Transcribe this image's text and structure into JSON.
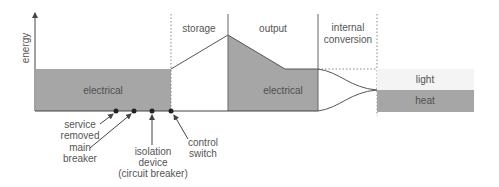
{
  "axis": {
    "y_label": "energy"
  },
  "colors": {
    "fill_gray": "#a6a6a6",
    "light_fill": "#f4f4f4",
    "line": "#555555",
    "text": "#555555"
  },
  "stages": [
    {
      "id": "input",
      "label": ""
    },
    {
      "id": "storage",
      "label": "storage"
    },
    {
      "id": "output",
      "label": "output"
    },
    {
      "id": "internal_conversion",
      "label_line1": "internal",
      "label_line2": "conversion"
    }
  ],
  "regions": {
    "input_electrical": "electrical",
    "output_electrical": "electrical",
    "light": "light",
    "heat": "heat"
  },
  "callouts": {
    "service_removed": {
      "line1": "service",
      "line2": "removed"
    },
    "main_breaker": {
      "line1": "main",
      "line2": "breaker"
    },
    "isolation_device": {
      "line1": "isolation",
      "line2": "device",
      "line3": "(circuit breaker)"
    },
    "control_switch": {
      "line1": "control",
      "line2": "switch"
    }
  }
}
